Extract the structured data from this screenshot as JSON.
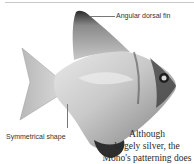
{
  "page": {
    "labels": {
      "dorsal_fin": "Angular dorsal fin",
      "shape": "Symmetrical shape"
    },
    "caption": {
      "lines": [
        "Although",
        "largely silver, the",
        "Mono's patterning does"
      ]
    },
    "image": {
      "subject": "fish-photo",
      "description": "Silver Mono (moonfish) with angular dorsal fin"
    }
  }
}
